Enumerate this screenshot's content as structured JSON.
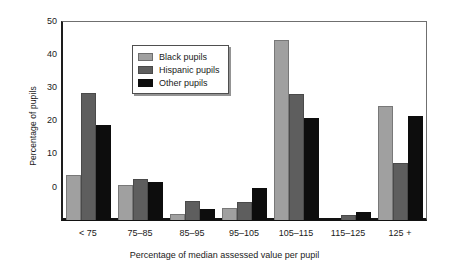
{
  "chart_data": {
    "type": "bar",
    "title": "",
    "xlabel": "Percentage of median assessed value per pupil",
    "ylabel": "Percentage of pupils",
    "categories": [
      "< 75",
      "75–85",
      "85–95",
      "95–105",
      "105–115",
      "115–125",
      "125 +"
    ],
    "series": [
      {
        "name": "Black pupils",
        "color": "#a0a0a0",
        "values": [
          11.4,
          8.8,
          1.4,
          3.1,
          45.2,
          0.0,
          28.6
        ]
      },
      {
        "name": "Hispanic pupils",
        "color": "#5e5e5e",
        "values": [
          31.9,
          10.3,
          4.8,
          4.5,
          31.6,
          1.3,
          14.3
        ]
      },
      {
        "name": "Other pupils",
        "color": "#0d0d0d",
        "values": [
          23.8,
          9.6,
          2.8,
          8.1,
          25.6,
          1.9,
          26.2
        ]
      }
    ],
    "ylim": [
      0,
      50
    ],
    "yticks": [
      0,
      10,
      20,
      30,
      40,
      50
    ],
    "grid": false,
    "legend_position": "upper-left-inset"
  },
  "axes": {
    "y_title": "Percentage of pupils",
    "x_title": "Percentage of median assessed value per pupil",
    "y_tick_labels": [
      "50",
      "40",
      "30",
      "20",
      "10",
      "0"
    ],
    "x_tick_labels": [
      "< 75",
      "75–85",
      "85–95",
      "95–105",
      "105–115",
      "115–125",
      "125 +"
    ]
  },
  "legend": {
    "items": [
      {
        "label": "Black pupils"
      },
      {
        "label": "Hispanic pupils"
      },
      {
        "label": "Other pupils"
      }
    ]
  },
  "colors": {
    "series_black_pupils": "#a0a0a0",
    "series_hispanic_pupils": "#5e5e5e",
    "series_other_pupils": "#0d0d0d",
    "axis": "#121212",
    "background": "#ffffff"
  }
}
